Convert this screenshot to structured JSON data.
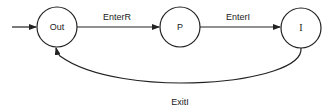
{
  "diagram": {
    "type": "state-machine",
    "states": [
      {
        "id": "out",
        "label": "Out"
      },
      {
        "id": "p",
        "label": "P"
      },
      {
        "id": "i",
        "label": "I"
      }
    ],
    "transitions": [
      {
        "from": "start",
        "to": "out",
        "label": ""
      },
      {
        "from": "out",
        "to": "p",
        "label": "EnterR"
      },
      {
        "from": "p",
        "to": "i",
        "label": "EnterI"
      },
      {
        "from": "i",
        "to": "out",
        "label": "ExitI"
      }
    ],
    "colors": {
      "stroke": "#222222",
      "background": "#ffffff"
    }
  }
}
